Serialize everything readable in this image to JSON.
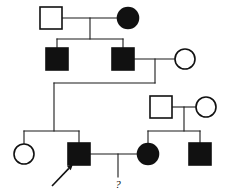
{
  "figure": {
    "type": "pedigree-chart",
    "width": 226,
    "height": 195,
    "background_color": "#ffffff",
    "line_color": "#1a1a1a",
    "affected_fill": "#111111",
    "unaffected_fill": "#ffffff",
    "proband_marker": "arrow",
    "unknown_marker_label": "?"
  },
  "legend_semantics": {
    "square": "male",
    "circle": "female",
    "filled": "affected",
    "open": "unaffected"
  },
  "individuals": [
    {
      "id": "I-1",
      "generation": 1,
      "sex": "male",
      "status": "unaffected",
      "shape": "square",
      "fill": "open",
      "cx": 51,
      "cy": 18,
      "size": 22
    },
    {
      "id": "I-2",
      "generation": 1,
      "sex": "female",
      "status": "affected",
      "shape": "circle",
      "fill": "filled",
      "cx": 128,
      "cy": 18,
      "size": 21
    },
    {
      "id": "II-1",
      "generation": 2,
      "sex": "male",
      "status": "affected",
      "shape": "square",
      "fill": "filled",
      "cx": 57,
      "cy": 59,
      "size": 22
    },
    {
      "id": "II-2",
      "generation": 2,
      "sex": "male",
      "status": "affected",
      "shape": "square",
      "fill": "filled",
      "cx": 123,
      "cy": 59,
      "size": 22
    },
    {
      "id": "II-3",
      "generation": 2,
      "sex": "female",
      "status": "unaffected",
      "shape": "circle",
      "fill": "open",
      "cx": 185,
      "cy": 59,
      "size": 20
    },
    {
      "id": "II-4",
      "generation": 2,
      "sex": "male",
      "status": "unaffected",
      "shape": "square",
      "fill": "open",
      "cx": 161,
      "cy": 107,
      "size": 22
    },
    {
      "id": "II-5",
      "generation": 2,
      "sex": "female",
      "status": "unaffected",
      "shape": "circle",
      "fill": "open",
      "cx": 206,
      "cy": 107,
      "size": 20
    },
    {
      "id": "III-1",
      "generation": 3,
      "sex": "female",
      "status": "unaffected",
      "shape": "circle",
      "fill": "open",
      "cx": 24,
      "cy": 154,
      "size": 20
    },
    {
      "id": "III-2",
      "generation": 3,
      "sex": "male",
      "status": "affected",
      "shape": "square",
      "fill": "filled",
      "cx": 79,
      "cy": 154,
      "size": 22,
      "is_proband": true
    },
    {
      "id": "III-3",
      "generation": 3,
      "sex": "female",
      "status": "affected",
      "shape": "circle",
      "fill": "filled",
      "cx": 148,
      "cy": 154,
      "size": 21
    },
    {
      "id": "III-4",
      "generation": 3,
      "sex": "male",
      "status": "affected",
      "shape": "square",
      "fill": "filled",
      "cx": 200,
      "cy": 154,
      "size": 22
    }
  ],
  "matings": [
    {
      "id": "mating-I",
      "partner_a": "I-1",
      "partner_b": "I-2",
      "line": {
        "x1": 62,
        "y1": 18,
        "x2": 117,
        "y2": 18
      },
      "descent_x": 90,
      "descent_y1": 18,
      "descent_y2": 39,
      "sibship_line": {
        "x": 57,
        "y": 39,
        "x2": 123
      },
      "children": [
        "II-1",
        "II-2"
      ]
    },
    {
      "id": "mating-II",
      "partner_a": "II-2",
      "partner_b": "II-3",
      "line": {
        "x1": 134,
        "y1": 59,
        "x2": 175,
        "y2": 59
      },
      "descent_x": 155,
      "descent_y1": 59,
      "descent_y2": 83,
      "elbow_to_x": 54,
      "drop_y2": 131,
      "children": [
        "III-1",
        "III-2"
      ]
    },
    {
      "id": "mating-III",
      "partner_a": "II-4",
      "partner_b": "II-5",
      "line": {
        "x1": 172,
        "y1": 107,
        "x2": 196,
        "y2": 107
      },
      "descent_x": 184,
      "descent_y1": 107,
      "descent_y2": 131,
      "sibship_line": {
        "x": 148,
        "y": 131,
        "x2": 200
      },
      "children": [
        "III-3",
        "III-4"
      ]
    },
    {
      "id": "mating-IV",
      "partner_a": "III-2",
      "partner_b": "III-3",
      "line": {
        "x1": 90,
        "y1": 154,
        "x2": 137,
        "y2": 154
      },
      "descent_x": 118,
      "descent_y1": 154,
      "descent_y2": 177,
      "children": [
        "unknown-child"
      ]
    }
  ],
  "sibship_lines": [
    {
      "id": "sibship-gen2",
      "x1": 57,
      "x2": 123,
      "y": 39
    },
    {
      "id": "sibship-gen3-left",
      "x1": 24,
      "x2": 79,
      "y": 131
    },
    {
      "id": "sibship-gen3-right",
      "x1": 148,
      "x2": 200,
      "y": 131
    }
  ],
  "connector_lines": [
    {
      "id": "stem-II-1",
      "x1": 57,
      "y1": 39,
      "x2": 57,
      "y2": 48
    },
    {
      "id": "stem-II-2",
      "x1": 123,
      "y1": 39,
      "x2": 123,
      "y2": 48
    },
    {
      "id": "stem-III-1",
      "x1": 24,
      "y1": 131,
      "x2": 24,
      "y2": 144
    },
    {
      "id": "stem-III-2",
      "x1": 79,
      "y1": 131,
      "x2": 79,
      "y2": 143
    },
    {
      "id": "stem-III-3",
      "x1": 148,
      "y1": 131,
      "x2": 148,
      "y2": 143
    },
    {
      "id": "stem-III-4",
      "x1": 200,
      "y1": 131,
      "x2": 200,
      "y2": 143
    },
    {
      "id": "descent-gen3-left-vertical",
      "x1": 54,
      "y1": 83,
      "x2": 54,
      "y2": 131
    },
    {
      "id": "descent-gen2-elbow",
      "x1": 54,
      "y1": 83,
      "x2": 155,
      "y2": 83
    }
  ],
  "annotations": [
    {
      "id": "proband-arrow",
      "type": "arrow",
      "target": "III-2",
      "label": "",
      "x1": 52,
      "y1": 186,
      "x2": 73,
      "y2": 164
    },
    {
      "id": "unknown-offspring",
      "type": "text",
      "label": "?",
      "x": 118,
      "y": 188
    }
  ]
}
